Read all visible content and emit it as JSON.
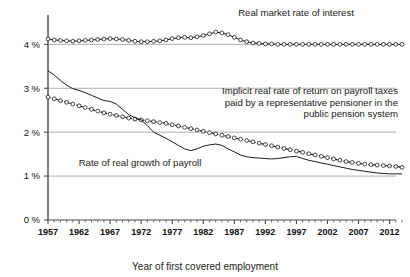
{
  "chart_data": {
    "type": "line",
    "title": "",
    "xlabel": "Year of first covered employment",
    "ylabel": "",
    "xlim": [
      1957,
      2014
    ],
    "ylim": [
      0,
      4.6
    ],
    "grid": true,
    "legend_position": "inline-annotations",
    "x_tick_labels": [
      "1957",
      "1962",
      "1967",
      "1972",
      "1977",
      "1982",
      "1987",
      "1992",
      "1997",
      "2002",
      "2007",
      "2012"
    ],
    "x_tick_values": [
      1957,
      1962,
      1967,
      1972,
      1977,
      1982,
      1987,
      1992,
      1997,
      2002,
      2007,
      2012
    ],
    "x_minor_tick_step": 1,
    "y_tick_labels": [
      "0 %",
      "1 %",
      "2 %",
      "3 %",
      "4 %"
    ],
    "y_tick_values": [
      0,
      1,
      2,
      3,
      4
    ],
    "x": [
      1957,
      1958,
      1959,
      1960,
      1961,
      1962,
      1963,
      1964,
      1965,
      1966,
      1967,
      1968,
      1969,
      1970,
      1971,
      1972,
      1973,
      1974,
      1975,
      1976,
      1977,
      1978,
      1979,
      1980,
      1981,
      1982,
      1983,
      1984,
      1985,
      1986,
      1987,
      1988,
      1989,
      1990,
      1991,
      1992,
      1993,
      1994,
      1995,
      1996,
      1997,
      1998,
      1999,
      2000,
      2001,
      2002,
      2003,
      2004,
      2005,
      2006,
      2007,
      2008,
      2009,
      2010,
      2011,
      2012,
      2013,
      2014
    ],
    "series": [
      {
        "name": "Real market rate of interest",
        "marker": "open-circle",
        "style": "solid",
        "values": [
          4.12,
          4.1,
          4.09,
          4.08,
          4.07,
          4.08,
          4.09,
          4.1,
          4.11,
          4.12,
          4.13,
          4.12,
          4.11,
          4.09,
          4.07,
          4.06,
          4.06,
          4.07,
          4.08,
          4.1,
          4.13,
          4.15,
          4.16,
          4.15,
          4.17,
          4.2,
          4.24,
          4.28,
          4.26,
          4.22,
          4.16,
          4.1,
          4.06,
          4.03,
          4.02,
          4.01,
          4.01,
          4.0,
          4.0,
          4.0,
          4.0,
          4.0,
          4.0,
          4.0,
          4.0,
          4.0,
          4.0,
          4.0,
          4.0,
          4.0,
          4.0,
          4.0,
          4.0,
          4.0,
          4.0,
          4.0,
          4.0,
          4.0
        ]
      },
      {
        "name": "Implicit real rate of return on payroll taxes paid by a representative pensioner in the public pension system",
        "marker": "open-circle",
        "style": "dashed",
        "values": [
          2.8,
          2.76,
          2.72,
          2.68,
          2.64,
          2.6,
          2.56,
          2.52,
          2.48,
          2.44,
          2.41,
          2.38,
          2.35,
          2.32,
          2.3,
          2.28,
          2.26,
          2.24,
          2.22,
          2.2,
          2.17,
          2.14,
          2.11,
          2.08,
          2.05,
          2.02,
          1.99,
          1.96,
          1.93,
          1.9,
          1.87,
          1.84,
          1.81,
          1.78,
          1.75,
          1.72,
          1.69,
          1.66,
          1.63,
          1.6,
          1.57,
          1.54,
          1.51,
          1.48,
          1.45,
          1.42,
          1.39,
          1.36,
          1.33,
          1.31,
          1.29,
          1.27,
          1.26,
          1.25,
          1.24,
          1.23,
          1.22,
          1.2
        ]
      },
      {
        "name": "Rate of real growth of payroll",
        "marker": "none",
        "style": "solid",
        "values": [
          3.4,
          3.3,
          3.18,
          3.07,
          2.99,
          2.95,
          2.9,
          2.84,
          2.78,
          2.72,
          2.7,
          2.64,
          2.52,
          2.4,
          2.33,
          2.28,
          2.15,
          2.0,
          1.93,
          1.86,
          1.78,
          1.7,
          1.62,
          1.58,
          1.62,
          1.68,
          1.71,
          1.73,
          1.7,
          1.62,
          1.55,
          1.48,
          1.44,
          1.42,
          1.41,
          1.4,
          1.39,
          1.4,
          1.42,
          1.44,
          1.45,
          1.4,
          1.36,
          1.33,
          1.3,
          1.27,
          1.24,
          1.21,
          1.18,
          1.15,
          1.13,
          1.11,
          1.09,
          1.07,
          1.06,
          1.05,
          1.05,
          1.05
        ]
      }
    ],
    "annotations": [
      {
        "id": "annotation-real-market-rate",
        "lines": [
          "Real market rate of interest"
        ],
        "align": "middle"
      },
      {
        "id": "annotation-implicit-real-rate",
        "lines": [
          "Implicit real rate of return on payroll taxes",
          "paid by a representative pensioner in the",
          "public pension system"
        ],
        "align": "end"
      },
      {
        "id": "annotation-rate-real-growth",
        "lines": [
          "Rate of real growth of payroll"
        ],
        "align": "middle"
      }
    ],
    "colors": {
      "line": "#1a1a1a",
      "grid": "#9a9a9a",
      "axis": "#4a4a4a",
      "marker_fill": "#ffffff",
      "background": "#ffffff"
    }
  }
}
